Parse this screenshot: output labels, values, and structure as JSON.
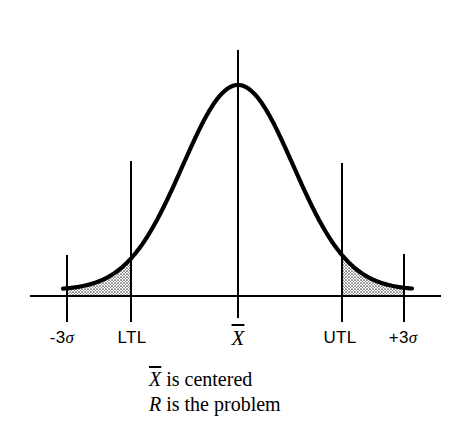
{
  "diagram": {
    "type": "normal-distribution-curve",
    "axis": {
      "labels": [
        {
          "id": "minus-3-sigma",
          "prefix": "-3",
          "symbol": "σ",
          "x": 67
        },
        {
          "id": "ltl",
          "text": "LTL",
          "x": 131
        },
        {
          "id": "mean",
          "symbol": "X",
          "overline": true,
          "x": 238
        },
        {
          "id": "utl",
          "text": "UTL",
          "x": 342
        },
        {
          "id": "plus-3-sigma",
          "prefix": "+3",
          "symbol": "σ",
          "x": 404
        }
      ]
    },
    "shaded_regions": [
      "below LTL (-3σ to LTL)",
      "above UTL (UTL to +3σ)"
    ],
    "caption": {
      "line1": {
        "var": "X",
        "overline": true,
        "text": " is centered"
      },
      "line2": {
        "var": "R",
        "text": " is the problem"
      }
    },
    "colors": {
      "ink": "#000000",
      "background": "#ffffff",
      "shade": "#888888"
    }
  }
}
